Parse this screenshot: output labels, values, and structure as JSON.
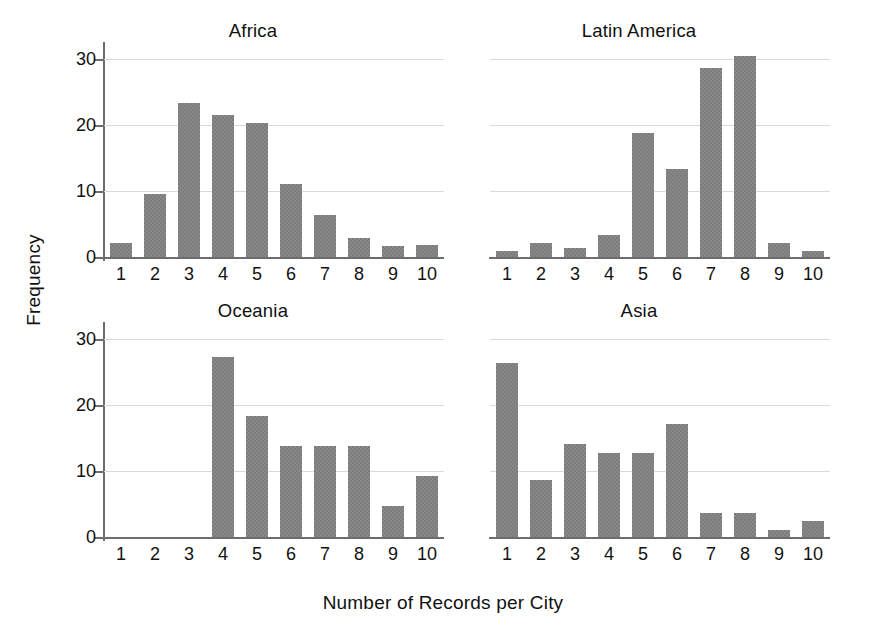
{
  "chart_data": {
    "type": "bar",
    "title": "",
    "xlabel": "Number of Records per City",
    "ylabel": "Frequency",
    "categories": [
      "1",
      "2",
      "3",
      "4",
      "5",
      "6",
      "7",
      "8",
      "9",
      "10"
    ],
    "ylim": [
      0,
      32
    ],
    "yticks": [
      0,
      10,
      20,
      30
    ],
    "ytick_labels": [
      "0",
      "10",
      "20",
      "30"
    ],
    "grid": "horizontal",
    "legend": "none",
    "bar_color": "#7c7c7c",
    "layout": "2x2 small multiples, shared x and y axes",
    "panels": [
      {
        "name": "Africa",
        "row": 0,
        "col": 0,
        "values": [
          2.1,
          9.6,
          23.4,
          21.5,
          20.4,
          11.1,
          6.3,
          2.9,
          1.6,
          1.8
        ]
      },
      {
        "name": "Latin America",
        "row": 0,
        "col": 1,
        "values": [
          0.9,
          2.1,
          1.3,
          3.4,
          18.8,
          13.4,
          28.7,
          30.5,
          2.1,
          0.9
        ]
      },
      {
        "name": "Oceania",
        "row": 1,
        "col": 0,
        "values": [
          0,
          0,
          0,
          27.3,
          18.3,
          13.8,
          13.8,
          13.8,
          4.7,
          9.3
        ]
      },
      {
        "name": "Asia",
        "row": 1,
        "col": 1,
        "values": [
          26.4,
          8.7,
          14.1,
          12.7,
          12.8,
          17.2,
          3.7,
          3.6,
          1.0,
          2.4
        ]
      }
    ]
  },
  "axes": {
    "y_title": "Frequency",
    "x_title": "Number of Records per City"
  },
  "panel_titles": {
    "top_left": "Africa",
    "top_right": "Latin America",
    "bottom_left": "Oceania",
    "bottom_right": "Asia"
  }
}
